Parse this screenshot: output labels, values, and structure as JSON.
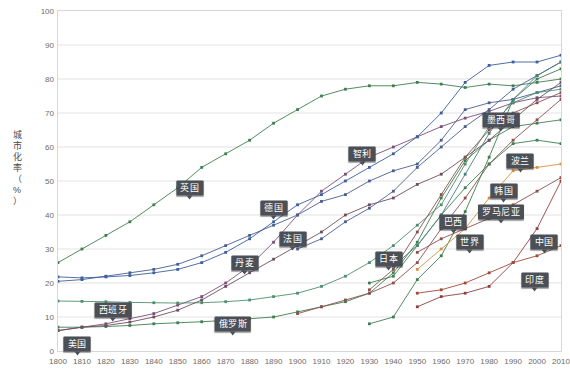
{
  "chart_data": {
    "type": "line",
    "title": "",
    "xlabel": "",
    "ylabel": "城市化率（%）",
    "ylabel_chars": [
      "城",
      "市",
      "化",
      "率",
      "（",
      "%",
      "）"
    ],
    "xlim": [
      1800,
      2010
    ],
    "ylim": [
      0,
      100
    ],
    "grid": true,
    "legend": "inline-callouts",
    "x_ticks": [
      "1800",
      "1810",
      "1820",
      "1830",
      "1840",
      "1850",
      "1860",
      "1870",
      "1880",
      "1890",
      "1900",
      "1910",
      "1920",
      "1930",
      "1940",
      "1950",
      "1960",
      "1970",
      "1980",
      "1990",
      "2000",
      "2010"
    ],
    "y_ticks": [
      "0",
      "10",
      "20",
      "30",
      "40",
      "50",
      "60",
      "70",
      "80",
      "90",
      "100"
    ],
    "series": [
      {
        "name": "英国",
        "color": "#3f7f4f",
        "x": [
          1800,
          1810,
          1820,
          1830,
          1840,
          1850,
          1860,
          1870,
          1880,
          1890,
          1900,
          1910,
          1920,
          1930,
          1940,
          1950,
          1960,
          1970,
          1980,
          1990,
          2000,
          2010
        ],
        "values": [
          26,
          30,
          34,
          38,
          43,
          48,
          54,
          58,
          62,
          67,
          71,
          75,
          77,
          78,
          78,
          79,
          78.5,
          77.5,
          78.5,
          78,
          79,
          80
        ]
      },
      {
        "name": "德国",
        "color": "#7a4f7a",
        "x": [
          1800,
          1810,
          1820,
          1830,
          1840,
          1850,
          1860,
          1870,
          1880,
          1890,
          1900,
          1910,
          1920,
          1930,
          1940,
          1950,
          1960,
          1970,
          1980,
          1990,
          2000,
          2010
        ],
        "values": [
          6,
          7,
          8,
          9.5,
          11,
          13.5,
          16,
          20,
          25,
          32,
          40,
          47,
          52,
          57,
          60,
          63,
          66,
          68.5,
          70.5,
          73,
          74.5,
          75
        ]
      },
      {
        "name": "法国",
        "color": "#4a5f8f",
        "x": [
          1800,
          1810,
          1820,
          1830,
          1840,
          1850,
          1860,
          1870,
          1880,
          1890,
          1900,
          1910,
          1920,
          1930,
          1940,
          1950,
          1960,
          1970,
          1980,
          1990,
          2000,
          2010
        ],
        "values": [
          20.5,
          21,
          22,
          23,
          24,
          25.5,
          28,
          31,
          34,
          37,
          40,
          44,
          46,
          50,
          53,
          55,
          62,
          71,
          73,
          74,
          76,
          78
        ]
      },
      {
        "name": "丹麦",
        "color": "#3b5fa0",
        "x": [
          1800,
          1810,
          1820,
          1830,
          1840,
          1850,
          1860,
          1870,
          1880,
          1890,
          1900,
          1910,
          1920,
          1930,
          1940,
          1950,
          1960,
          1970,
          1980,
          1990,
          2000,
          2010
        ],
        "values": [
          21.8,
          21.5,
          21.8,
          22.2,
          23,
          24,
          26,
          29,
          33,
          38,
          43,
          46,
          50,
          54,
          58,
          63,
          70,
          79,
          84,
          85,
          85,
          87
        ]
      },
      {
        "name": "西班牙",
        "color": "#4f8f6f",
        "x": [
          1800,
          1810,
          1820,
          1830,
          1840,
          1850,
          1860,
          1870,
          1880,
          1890,
          1900,
          1910,
          1920,
          1930,
          1940,
          1950,
          1960,
          1970,
          1980,
          1990,
          2000,
          2010
        ],
        "values": [
          14.7,
          14.6,
          14.5,
          14.3,
          14.2,
          14.1,
          14.2,
          14.5,
          15,
          16,
          17,
          19,
          22,
          26,
          31,
          37,
          43,
          55,
          66,
          73,
          76,
          77
        ]
      },
      {
        "name": "俄罗斯",
        "color": "#3f7f4f",
        "x": [
          1800,
          1810,
          1820,
          1830,
          1840,
          1850,
          1860,
          1870,
          1880,
          1890,
          1900,
          1910,
          1920,
          1930,
          1940,
          1950,
          1960,
          1970,
          1980,
          1990,
          2000,
          2010
        ],
        "values": [
          7,
          7,
          7.2,
          7.5,
          8,
          8.3,
          8.6,
          9,
          9.5,
          10,
          11.5,
          13,
          14.5,
          17,
          23,
          32,
          45,
          56,
          62,
          66,
          67,
          68
        ]
      },
      {
        "name": "美国",
        "color": "#6f4f5f",
        "x": [
          1800,
          1810,
          1820,
          1830,
          1840,
          1850,
          1860,
          1870,
          1880,
          1890,
          1900,
          1910,
          1920,
          1930,
          1940,
          1950,
          1960,
          1970,
          1980,
          1990,
          2000,
          2010
        ],
        "values": [
          6,
          7,
          7.5,
          8.5,
          10,
          12,
          15,
          19,
          23,
          27,
          31,
          35,
          40,
          43,
          45,
          49,
          52,
          57,
          62,
          68,
          74,
          79
        ]
      },
      {
        "name": "日本",
        "color": "#8f4f4f",
        "x": [
          1930,
          1940,
          1950,
          1960,
          1970,
          1980,
          1990,
          2000,
          2010
        ],
        "values": [
          18,
          24,
          35,
          46,
          57,
          65,
          70,
          73,
          76
        ]
      },
      {
        "name": "智利",
        "color": "#4a5f8f",
        "x": [
          1900,
          1910,
          1920,
          1930,
          1940,
          1950,
          1960,
          1970,
          1980,
          1990,
          2000,
          2010
        ],
        "values": [
          30,
          33,
          38,
          42,
          47,
          54,
          60,
          66,
          71,
          77,
          81,
          85
        ]
      },
      {
        "name": "墨西哥",
        "color": "#8f4f4f",
        "x": [
          1900,
          1910,
          1920,
          1930,
          1940,
          1950,
          1960,
          1970,
          1980,
          1990,
          2000,
          2010
        ],
        "values": [
          11,
          13,
          15,
          17,
          20,
          26,
          36,
          45,
          55,
          62,
          68,
          74
        ]
      },
      {
        "name": "波兰",
        "color": "#3f7f4f",
        "x": [
          1930,
          1940,
          1950,
          1960,
          1970,
          1980,
          1990,
          2000,
          2010
        ],
        "values": [
          20,
          22,
          31,
          40,
          48,
          55,
          61,
          62,
          61
        ]
      },
      {
        "name": "韩国",
        "color": "#3f7f4f",
        "x": [
          1930,
          1940,
          1950,
          1960,
          1970,
          1980,
          1990,
          2000,
          2010
        ],
        "values": [
          8,
          10,
          21,
          28,
          41,
          57,
          74,
          80,
          83
        ]
      },
      {
        "name": "巴西",
        "color": "#4a7f7f",
        "x": [
          1940,
          1950,
          1960,
          1970,
          1980,
          1990,
          2000,
          2010
        ],
        "values": [
          25,
          31,
          40,
          52,
          64,
          74,
          81,
          85
        ]
      },
      {
        "name": "罗马尼亚",
        "color": "#d89040",
        "x": [
          1950,
          1960,
          1970,
          1980,
          1990,
          2000,
          2010
        ],
        "values": [
          24,
          30,
          36,
          45,
          53,
          54,
          55
        ]
      },
      {
        "name": "世界",
        "color": "#8f4f4f",
        "x": [
          1950,
          1960,
          1970,
          1980,
          1990,
          2000,
          2010
        ],
        "values": [
          29,
          33,
          36,
          39,
          43,
          47,
          51
        ]
      },
      {
        "name": "中国",
        "color": "#8f3f3f",
        "x": [
          1950,
          1960,
          1970,
          1980,
          1990,
          2000,
          2010
        ],
        "values": [
          13,
          16,
          17,
          19,
          26,
          36,
          50
        ]
      },
      {
        "name": "印度",
        "color": "#a04a3a",
        "x": [
          1950,
          1960,
          1970,
          1980,
          1990,
          2000,
          2010
        ],
        "values": [
          17,
          18,
          20,
          23,
          26,
          28,
          31
        ]
      }
    ],
    "annotations": [
      {
        "label": "英国",
        "x": 1855,
        "y": 48
      },
      {
        "label": "德国",
        "x": 1890,
        "y": 42
      },
      {
        "label": "法国",
        "x": 1898,
        "y": 33
      },
      {
        "label": "丹麦",
        "x": 1878,
        "y": 26
      },
      {
        "label": "西班牙",
        "x": 1823,
        "y": 12
      },
      {
        "label": "俄罗斯",
        "x": 1873,
        "y": 8
      },
      {
        "label": "美国",
        "x": 1808,
        "y": 2
      },
      {
        "label": "日本",
        "x": 1938,
        "y": 27
      },
      {
        "label": "智利",
        "x": 1927,
        "y": 58
      },
      {
        "label": "墨西哥",
        "x": 1985,
        "y": 68
      },
      {
        "label": "波兰",
        "x": 1993,
        "y": 56
      },
      {
        "label": "韩国",
        "x": 1986,
        "y": 47
      },
      {
        "label": "巴西",
        "x": 1965,
        "y": 38
      },
      {
        "label": "罗马尼亚",
        "x": 1985,
        "y": 41
      },
      {
        "label": "世界",
        "x": 1972,
        "y": 32
      },
      {
        "label": "中国",
        "x": 2003,
        "y": 32
      },
      {
        "label": "印度",
        "x": 1999,
        "y": 21
      }
    ]
  }
}
